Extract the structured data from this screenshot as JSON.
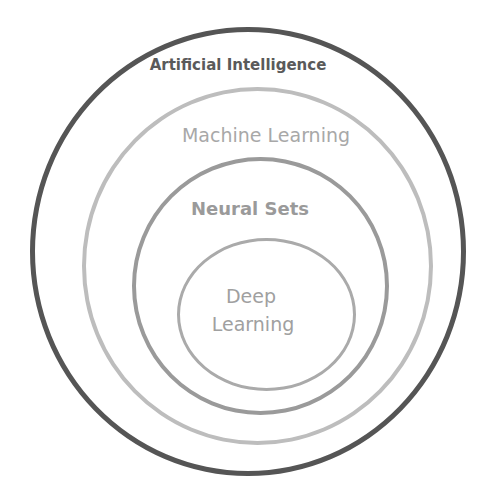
{
  "diagram": {
    "type": "nested-circles",
    "layers": [
      {
        "id": "ai",
        "label": "Artificial Intelligence",
        "color": "#555555",
        "text_color": "#5a5a5a"
      },
      {
        "id": "ml",
        "label": "Machine Learning",
        "color": "#bdbdbd",
        "text_color": "#a8a8a8"
      },
      {
        "id": "ns",
        "label": "Neural Sets",
        "color": "#9a9a9a",
        "text_color": "#9a9a9a"
      },
      {
        "id": "dl",
        "label_line1": "Deep",
        "label_line2": "Learning",
        "color": "#aaaaaa",
        "text_color": "#a0a0a0"
      }
    ]
  }
}
